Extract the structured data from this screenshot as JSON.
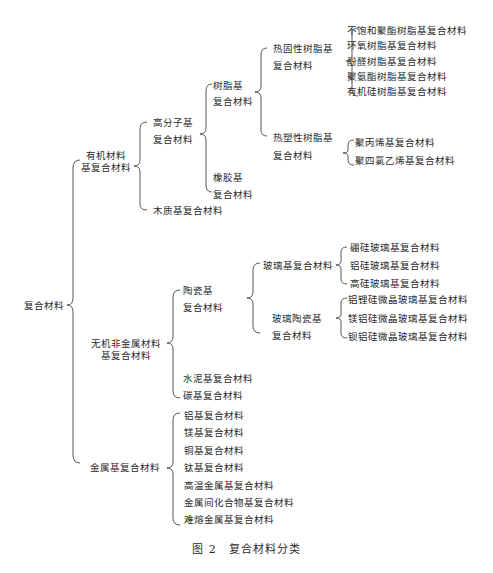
{
  "root": "复合材料",
  "organic": {
    "label_line1": "有机材料",
    "label_line2": "基复合材料",
    "polymer": {
      "line1": "高分子基",
      "line2": "复合材料",
      "resin": {
        "line1": "树脂基",
        "line2": "复合材料",
        "thermoset": {
          "line1": "热固性树脂基",
          "line2": "复合材料",
          "items": [
            "不饱和聚酯树脂基复合材料",
            "环氧树脂基复合材料",
            "酚醛树脂基复合材料",
            "聚氨酯树脂基复合材料",
            "有机硅树脂基复合材料"
          ]
        },
        "thermoplastic": {
          "line1": "热塑性树脂基",
          "line2": "复合材料",
          "items": [
            "聚丙烯基复合材料",
            "聚四氯乙烯基复合材料"
          ]
        }
      },
      "rubber": {
        "line1": "橡胶基",
        "line2": "复合材料"
      }
    },
    "wood": "木质基复合材料"
  },
  "inorganic": {
    "label_line1": "无机非金属材料",
    "label_line2": "基复合材料",
    "ceramic": {
      "line1": "陶瓷基",
      "line2": "复合材料",
      "glass": {
        "label": "玻璃基复合材料",
        "items": [
          "硼硅玻璃基复合材料",
          "铝硅玻璃基复合材料",
          "高硅玻璃基复合材料"
        ]
      },
      "glass_ceramic": {
        "line1": "玻璃陶瓷基",
        "line2": "复合材料",
        "items": [
          "铝锂硅微晶玻璃基复合材料",
          "镁铝硅微晶玻璃基复合材料",
          "钡铝硅微晶玻璃基复合材料"
        ]
      }
    },
    "cement": "水泥基复合材料",
    "carbon": "碳基复合材料"
  },
  "metal": {
    "label": "金属基复合材料",
    "items": [
      "铝基复合材料",
      "镁基复合材料",
      "铜基复合材料",
      "钛基复合材料",
      "高温金属基复合材料",
      "金属间化合物基复合材料",
      "难熔金属基复合材料"
    ]
  },
  "caption": "图 2　复合材料分类"
}
